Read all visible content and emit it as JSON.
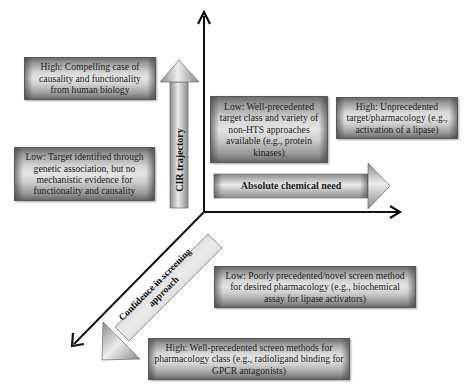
{
  "diagram": {
    "type": "three-axis conceptual diagram",
    "axes": {
      "vertical": {
        "label": "CIR trajectory"
      },
      "horizontal": {
        "label": "Absolute chemical need"
      },
      "diagonal": {
        "label": "Confidence in screening approach"
      }
    },
    "boxes": {
      "cir_high": "High: Compelling case of causality and functionality from human biology",
      "cir_low": "Low: Target identified through genetic association, but no mechanistic evidence for functionality and causality",
      "chem_low": "Low: Well-precedented target class and variety of non-HTS approaches available (e.g., protein kinases)",
      "chem_high": "High: Unprecedented target/pharmacology (e.g., activation of a lipase)",
      "screen_low": "Low: Poorly precedented/novel screen method for desired pharmacology (e.g., biochemical assay for lipase activators)",
      "screen_high": "High: Well-precedented screen methods for pharmacology class (e.g., radioligand binding for GPCR antagonists)"
    },
    "colors": {
      "axis": "#111111",
      "box_dark": "#6d6d6d",
      "box_light": "#e4e4e4",
      "background": "#ffffff"
    }
  }
}
